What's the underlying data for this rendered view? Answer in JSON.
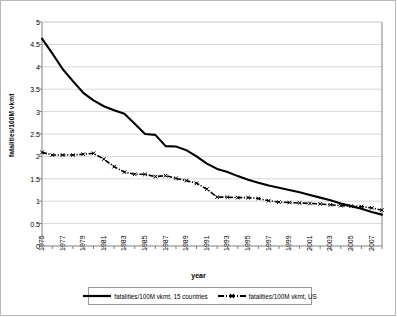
{
  "chart_data": {
    "type": "line",
    "title": "",
    "xlabel": "year",
    "ylabel": "fatalities/100M vkmt",
    "grid": true,
    "legend_position": "bottom",
    "xlim": [
      1975,
      2008
    ],
    "ylim": [
      0,
      5
    ],
    "ytick_labels": [
      "5",
      "4.5",
      "4",
      "3.5",
      "3",
      "2.5",
      "2",
      "1.5",
      "1",
      "0.5",
      "0"
    ],
    "ytick_values": [
      5,
      4.5,
      4,
      3.5,
      3,
      2.5,
      2,
      1.5,
      1,
      0.5,
      0
    ],
    "xtick_labels": [
      "1975",
      "1977",
      "1979",
      "1981",
      "1983",
      "1985",
      "1987",
      "1989",
      "1991",
      "1993",
      "1995",
      "1997",
      "1999",
      "2001",
      "2003",
      "2005",
      "2007"
    ],
    "xtick_values": [
      1975,
      1977,
      1979,
      1981,
      1983,
      1985,
      1987,
      1989,
      1991,
      1993,
      1995,
      1997,
      1999,
      2001,
      2003,
      2005,
      2007
    ],
    "x": [
      1975,
      1976,
      1977,
      1978,
      1979,
      1980,
      1981,
      1982,
      1983,
      1984,
      1985,
      1986,
      1987,
      1988,
      1989,
      1990,
      1991,
      1992,
      1993,
      1994,
      1995,
      1996,
      1997,
      1998,
      1999,
      2000,
      2001,
      2002,
      2003,
      2004,
      2005,
      2006,
      2007,
      2008
    ],
    "series": [
      {
        "name": "fatalities/100M vkmt, 15 countries",
        "style": "solid",
        "color": "#000000",
        "values": [
          4.63,
          4.3,
          3.95,
          3.68,
          3.42,
          3.25,
          3.12,
          3.03,
          2.95,
          2.73,
          2.5,
          2.48,
          2.23,
          2.22,
          2.14,
          2.0,
          1.84,
          1.72,
          1.65,
          1.56,
          1.48,
          1.41,
          1.35,
          1.3,
          1.25,
          1.2,
          1.14,
          1.08,
          1.02,
          0.95,
          0.89,
          0.83,
          0.76,
          0.7
        ]
      },
      {
        "name": "fatalities/100M vkmt, US",
        "style": "dash-dot-marker",
        "color": "#000000",
        "values": [
          2.09,
          2.03,
          2.03,
          2.03,
          2.05,
          2.07,
          1.94,
          1.77,
          1.65,
          1.6,
          1.6,
          1.55,
          1.57,
          1.51,
          1.46,
          1.4,
          1.27,
          1.09,
          1.09,
          1.08,
          1.08,
          1.06,
          1.01,
          0.98,
          0.97,
          0.96,
          0.95,
          0.94,
          0.92,
          0.9,
          0.89,
          0.88,
          0.85,
          0.8
        ]
      }
    ]
  },
  "legend": {
    "items": [
      {
        "label": "fatalities/100M vkmt, 15 countries",
        "style": "solid"
      },
      {
        "label": "fatalities/100M vkmt, US",
        "style": "dash-dot-marker"
      }
    ]
  },
  "axes": {
    "x_title": "year",
    "y_title": "fatalities/100M vkmt"
  },
  "colors": {
    "plot_border": "#808080",
    "gridline": "#d8d8d8",
    "series_line": "#000000",
    "legend_border": "#9a9a9a",
    "outer_frame": "#b8b8b8",
    "background": "#ffffff"
  }
}
